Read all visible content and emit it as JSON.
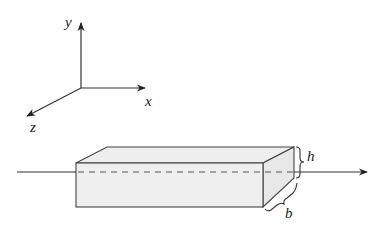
{
  "diagram": {
    "axes": {
      "labels": {
        "y": "y",
        "x": "x",
        "z": "z"
      },
      "origin": [
        81,
        88
      ]
    },
    "beam": {
      "fill_color": "#ececec",
      "stroke_color": "#444444",
      "dimensions": {
        "height_label": "h",
        "width_label": "b"
      }
    },
    "centroidal_axis": {
      "style": "solid outside, dashed inside beam",
      "direction": "positive x"
    }
  }
}
